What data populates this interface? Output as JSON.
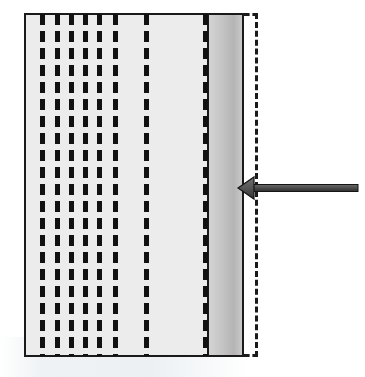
{
  "figure": {
    "type": "technical-cross-section-diagram",
    "width": 365,
    "height": 377,
    "background_color": "#ffffff",
    "title": "",
    "caption": ""
  },
  "colors": {
    "outline": "#1a1a1a",
    "body_fill": "#ececed",
    "edge_layer_light": "#d4d4d4",
    "edge_layer_mid": "#c2c2c2",
    "edge_layer_dark": "#b4b4b4",
    "fiber_dash": "#111111",
    "arrow_fill": "#5e5e5e",
    "arrow_stroke": "#1a1a1a",
    "watermark": "#e2e8ec"
  },
  "specimen_body": {
    "name": "specimen-body",
    "x": 24,
    "y": 13,
    "width": 220,
    "height": 344,
    "fill": "#ececed",
    "stroke_width": 2,
    "label": ""
  },
  "edge_layer": {
    "name": "graded-edge-layer",
    "x": 207,
    "y": 13,
    "width": 37,
    "height": 344,
    "gradient_from": "#d4d4d4",
    "gradient_to": "#b4b4b4",
    "label": ""
  },
  "boundary_outline": {
    "name": "dashed-boundary-outline",
    "x": 244,
    "y": 13,
    "width": 14,
    "height": 344,
    "dash_width": 3,
    "style": "dashed",
    "label": ""
  },
  "fiber_columns": {
    "name": "dashed-fiber-columns",
    "count": 10,
    "dash_length": 11,
    "dash_gap": 6,
    "dash_width": 5,
    "top": 14,
    "height": 342,
    "x_positions": [
      40,
      55,
      69,
      83,
      97,
      113,
      144,
      203
    ],
    "cluster_note": ""
  },
  "load_arrow": {
    "name": "load-arrow",
    "direction": "left",
    "tip_x": 238,
    "tip_y": 188,
    "tail_x": 358,
    "shaft_thickness": 7,
    "head_width": 16,
    "head_height": 22,
    "label": ""
  },
  "chart_data": {
    "type": "diagram",
    "title": "",
    "elements": [
      {
        "name": "specimen-body",
        "shape": "rectangle",
        "x": 24,
        "y": 13,
        "w": 220,
        "h": 344
      },
      {
        "name": "graded-edge-layer",
        "shape": "rectangle",
        "x": 207,
        "y": 13,
        "w": 37,
        "h": 344
      },
      {
        "name": "dashed-boundary-outline",
        "shape": "open-rectangle",
        "x": 244,
        "y": 13,
        "w": 14,
        "h": 344
      },
      {
        "name": "load-arrow",
        "shape": "arrow",
        "from_x": 358,
        "from_y": 188,
        "to_x": 238,
        "to_y": 188
      }
    ],
    "annotations": []
  }
}
